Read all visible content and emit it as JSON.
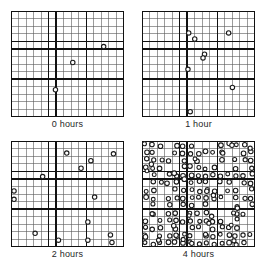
{
  "figure": {
    "title": "",
    "marker_shape": "open-circle",
    "marker_color": "#1a1a1a",
    "grid_minor_color": "#5a5a5a",
    "grid_major_color": "#111111",
    "background_color": "#ffffff",
    "panel_width_px": 113,
    "panel_height_px": 106
  },
  "chart_data": {
    "type": "scatter",
    "title": "",
    "xlabel": "",
    "ylabel": "",
    "xlim": [
      0,
      15
    ],
    "ylim": [
      0,
      14
    ],
    "grid": true,
    "grid_minor_cols": 15,
    "grid_minor_rows": 14,
    "grid_major_cols": [
      5,
      6,
      10
    ],
    "grid_major_rows": [
      4,
      5,
      9
    ],
    "legend_position": "none",
    "panels": [
      {
        "label": "0 hours",
        "time_hours": 0,
        "count": 3,
        "points": [
          {
            "x": 12.3,
            "y": 9.3
          },
          {
            "x": 8.2,
            "y": 7.2
          },
          {
            "x": 5.9,
            "y": 3.6
          }
        ]
      },
      {
        "label": "1 hour",
        "time_hours": 1,
        "count": 7,
        "points": [
          {
            "x": 6.2,
            "y": 11.1
          },
          {
            "x": 7.0,
            "y": 10.3
          },
          {
            "x": 11.5,
            "y": 11.1
          },
          {
            "x": 8.3,
            "y": 8.3
          },
          {
            "x": 8.1,
            "y": 7.8
          },
          {
            "x": 6.1,
            "y": 6.3
          },
          {
            "x": 12.0,
            "y": 3.9
          },
          {
            "x": 6.4,
            "y": 0.7
          }
        ]
      },
      {
        "label": "2 hours",
        "time_hours": 2,
        "count": 14,
        "points": [
          {
            "x": 7.4,
            "y": 12.4
          },
          {
            "x": 13.6,
            "y": 12.3
          },
          {
            "x": 10.6,
            "y": 11.4
          },
          {
            "x": 9.3,
            "y": 10.4
          },
          {
            "x": 4.2,
            "y": 9.3
          },
          {
            "x": 0.4,
            "y": 7.4
          },
          {
            "x": 0.4,
            "y": 6.3
          },
          {
            "x": 11.1,
            "y": 6.6
          },
          {
            "x": 10.2,
            "y": 3.3
          },
          {
            "x": 3.2,
            "y": 1.8
          },
          {
            "x": 6.3,
            "y": 0.9
          },
          {
            "x": 10.2,
            "y": 0.9
          },
          {
            "x": 13.2,
            "y": 1.6
          },
          {
            "x": 13.4,
            "y": 0.6
          }
        ]
      },
      {
        "label": "4 hours",
        "time_hours": 4,
        "count": 150,
        "density": "saturated",
        "points": []
      }
    ]
  },
  "captions": {
    "panel_0": "0 hours",
    "panel_1": "1 hour",
    "panel_2": "2 hours",
    "panel_3": "4 hours"
  }
}
